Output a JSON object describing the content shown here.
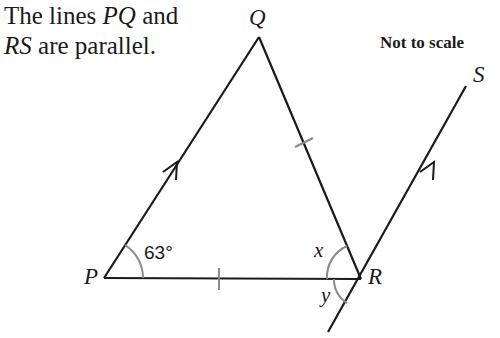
{
  "intro": {
    "line1_prefix": "The lines ",
    "line1_var": "PQ",
    "line1_suffix": " and",
    "line2_var": "RS",
    "line2_suffix": " are parallel."
  },
  "note": "Not to scale",
  "vertices": {
    "P": "P",
    "Q": "Q",
    "R": "R",
    "S": "S"
  },
  "angles": {
    "p_angle": "63°",
    "x_label": "x",
    "y_label": "y"
  },
  "colors": {
    "line": "#1a1a1a",
    "mark": "#8a8a8a"
  }
}
